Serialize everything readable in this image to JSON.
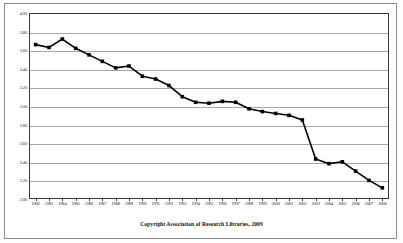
{
  "caption": "Copyright Association of Research Libraries, 2009",
  "chart_data": {
    "type": "line",
    "title": "",
    "xlabel": "",
    "ylabel": "",
    "ylim": [
      2.0,
      4.0
    ],
    "ytick_step": 0.2,
    "grid": true,
    "legend": null,
    "marker": "filled-square",
    "line_color": "#000000",
    "marker_color": "#000000",
    "ytick_labels": [
      "4.00",
      "3.80",
      "3.60",
      "3.40",
      "3.20",
      "3.00",
      "2.80",
      "2.60",
      "2.40",
      "2.20",
      "2.00"
    ],
    "categories": [
      "1982",
      "1983",
      "1984",
      "1985",
      "1986",
      "1987",
      "1988",
      "1989",
      "1990",
      "1991",
      "1992",
      "1993",
      "1994",
      "1995",
      "1996",
      "1997",
      "1998",
      "1999",
      "2000",
      "2001",
      "2002",
      "2003",
      "2004",
      "2005",
      "2006",
      "2007",
      "2008"
    ],
    "values": [
      3.66,
      3.63,
      3.72,
      3.62,
      3.55,
      3.48,
      3.41,
      3.43,
      3.32,
      3.29,
      3.22,
      3.1,
      3.04,
      3.03,
      3.05,
      3.04,
      2.97,
      2.94,
      2.92,
      2.9,
      2.85,
      2.43,
      2.38,
      2.4,
      2.3,
      2.2,
      2.12
    ]
  }
}
